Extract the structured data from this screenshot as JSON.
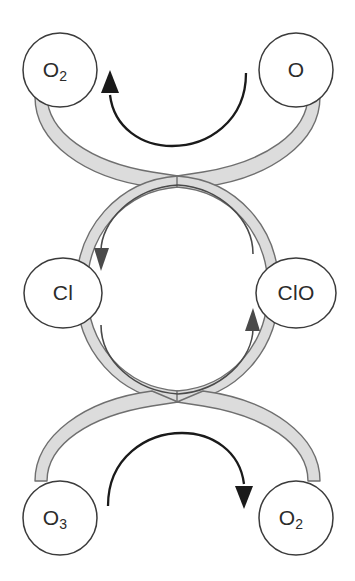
{
  "diagram": {
    "colors": {
      "ribbon_fill": "#dcdcdc",
      "ribbon_stroke": "#6f6f6f",
      "node_fill": "#ffffff",
      "node_stroke": "#3b3b3b",
      "label_text": "#2b2b2b",
      "outer_arrow": "#1a1a1a",
      "inner_arrow": "#4a4a4a",
      "background": "#ffffff"
    },
    "nodes": [
      {
        "id": "o2-top-left",
        "label_main": "O",
        "label_sub": "2",
        "position": "top-left",
        "role": "product"
      },
      {
        "id": "o-top-right",
        "label_main": "O",
        "label_sub": "",
        "position": "top-right",
        "role": "reactant"
      },
      {
        "id": "cl-middle-left",
        "label_main": "Cl",
        "label_sub": "",
        "position": "middle-left",
        "role": "catalyst"
      },
      {
        "id": "clo-middle-right",
        "label_main": "ClO",
        "label_sub": "",
        "position": "middle-right",
        "role": "intermediate"
      },
      {
        "id": "o3-bottom-left",
        "label_main": "O",
        "label_sub": "3",
        "position": "bottom-left",
        "role": "reactant"
      },
      {
        "id": "o2-bottom-right",
        "label_main": "O",
        "label_sub": "2",
        "position": "bottom-right",
        "role": "product"
      }
    ],
    "arrows": [
      {
        "id": "top-arc-arrow",
        "direction": "right-to-left",
        "from": "o-top-right",
        "to": "o2-top-left",
        "style": "outer"
      },
      {
        "id": "bottom-arc-arrow",
        "direction": "left-to-right",
        "from": "o3-bottom-left",
        "to": "o2-bottom-right",
        "style": "outer"
      },
      {
        "id": "inner-left-arrow",
        "direction": "downward",
        "from": "clo-middle-right",
        "to": "cl-middle-left",
        "style": "inner"
      },
      {
        "id": "inner-right-arrow",
        "direction": "upward",
        "from": "cl-middle-left",
        "to": "clo-middle-right",
        "style": "inner"
      }
    ]
  }
}
